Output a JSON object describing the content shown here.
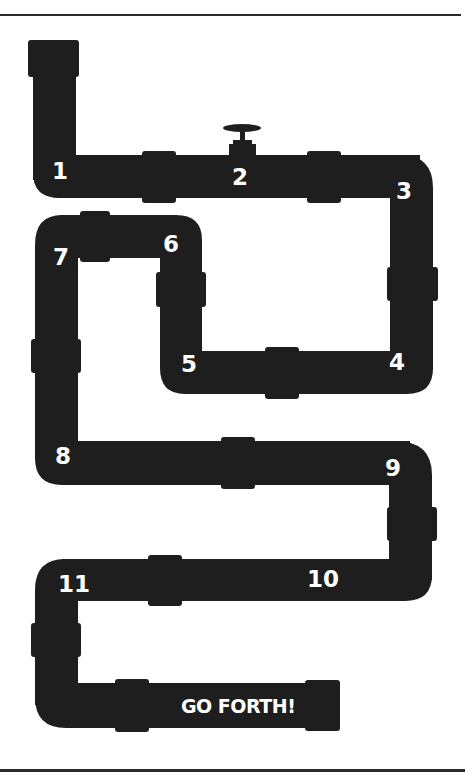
{
  "diagram": {
    "pipe_color": "#1e1e1e",
    "label_color": "#ffffff",
    "rule_color": "#2b2b2b",
    "steps": [
      {
        "label": "1",
        "x": 52,
        "y": 160
      },
      {
        "label": "2",
        "x": 232,
        "y": 166
      },
      {
        "label": "3",
        "x": 396,
        "y": 180
      },
      {
        "label": "4",
        "x": 389,
        "y": 351
      },
      {
        "label": "5",
        "x": 181,
        "y": 353
      },
      {
        "label": "6",
        "x": 163,
        "y": 233
      },
      {
        "label": "7",
        "x": 53,
        "y": 246
      },
      {
        "label": "8",
        "x": 55,
        "y": 445
      },
      {
        "label": "9",
        "x": 385,
        "y": 457
      },
      {
        "label": "10",
        "x": 307,
        "y": 568
      },
      {
        "label": "11",
        "x": 58,
        "y": 573
      }
    ],
    "end_label": "GO FORTH!",
    "features": [
      "valve-on-segment-1-2",
      "end-cap-at-start",
      "end-cap-at-finish"
    ]
  }
}
